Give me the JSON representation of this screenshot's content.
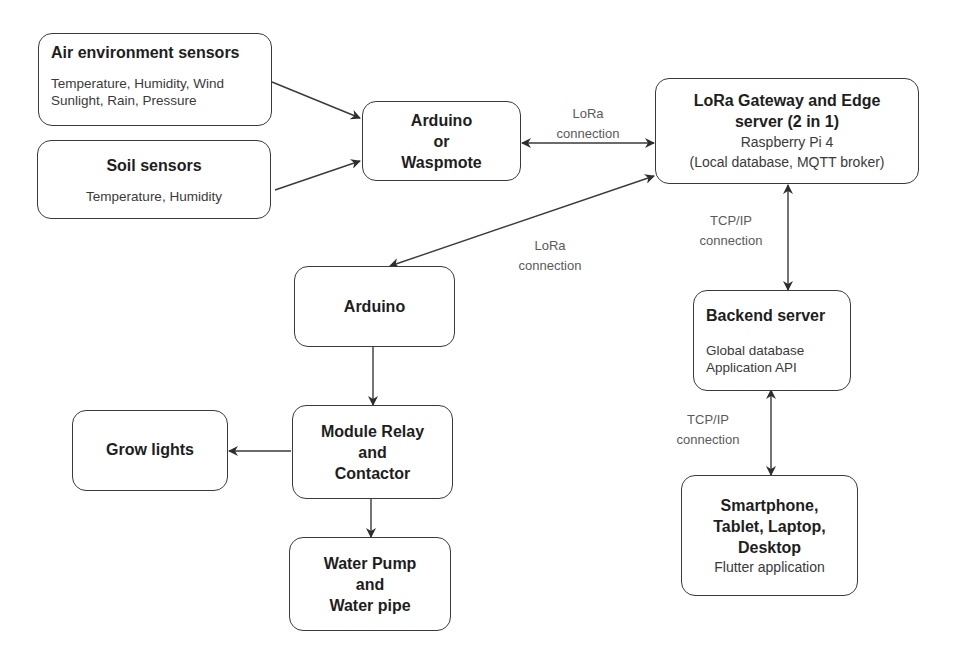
{
  "nodes": {
    "air_sensors": {
      "title": "Air environment sensors",
      "lines": [
        "Temperature, Humidity, Wind",
        "Sunlight, Rain, Pressure"
      ]
    },
    "soil_sensors": {
      "title": "Soil sensors",
      "lines": [
        "Temperature, Humidity"
      ]
    },
    "arduino_waspmote": {
      "title_lines": [
        "Arduino",
        "or",
        "Waspmote"
      ]
    },
    "lora_gateway": {
      "title_lines": [
        "LoRa Gateway and Edge",
        "server (2 in 1)"
      ],
      "lines": [
        "Raspberry Pi 4",
        "(Local database, MQTT broker)"
      ]
    },
    "arduino": {
      "title": "Arduino"
    },
    "backend_server": {
      "title": "Backend server",
      "lines": [
        "Global database",
        "Application API"
      ]
    },
    "module_relay": {
      "title_lines": [
        "Module Relay",
        "and",
        "Contactor"
      ]
    },
    "grow_lights": {
      "title": "Grow lights"
    },
    "water_pump": {
      "title_lines": [
        "Water Pump",
        "and",
        "Water pipe"
      ]
    },
    "client_devices": {
      "title_lines": [
        "Smartphone,",
        "Tablet, Laptop,",
        "Desktop"
      ],
      "lines": [
        "Flutter application"
      ]
    }
  },
  "edge_labels": {
    "lora_top": [
      "LoRa",
      "connection"
    ],
    "lora_mid": [
      "LoRa",
      "connection"
    ],
    "tcp_top": [
      "TCP/IP",
      "connection"
    ],
    "tcp_bottom": [
      "TCP/IP",
      "connection"
    ]
  },
  "edges": [
    {
      "from": "Air environment sensors",
      "to": "Arduino or Waspmote",
      "direction": "forward"
    },
    {
      "from": "Soil sensors",
      "to": "Arduino or Waspmote",
      "direction": "forward"
    },
    {
      "from": "Arduino or Waspmote",
      "to": "LoRa Gateway and Edge server",
      "direction": "both",
      "label": "LoRa connection"
    },
    {
      "from": "LoRa Gateway and Edge server",
      "to": "Arduino",
      "direction": "both",
      "label": "LoRa connection"
    },
    {
      "from": "LoRa Gateway and Edge server",
      "to": "Backend server",
      "direction": "both",
      "label": "TCP/IP connection"
    },
    {
      "from": "Backend server",
      "to": "Smartphone, Tablet, Laptop, Desktop",
      "direction": "both",
      "label": "TCP/IP connection"
    },
    {
      "from": "Arduino",
      "to": "Module Relay and Contactor",
      "direction": "forward"
    },
    {
      "from": "Module Relay and Contactor",
      "to": "Grow lights",
      "direction": "forward"
    },
    {
      "from": "Module Relay and Contactor",
      "to": "Water Pump and Water pipe",
      "direction": "forward"
    }
  ],
  "colors": {
    "stroke": "#3a3a3a",
    "label": "#5a5a5a",
    "background": "#ffffff"
  }
}
